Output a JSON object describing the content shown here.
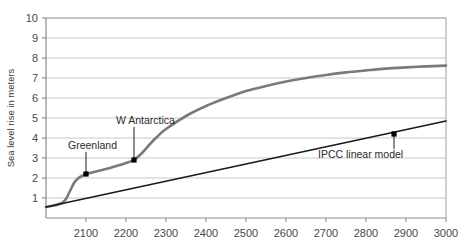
{
  "chart_data": {
    "type": "line",
    "title": "",
    "xlabel": "",
    "ylabel": "Sea level rise in meters",
    "xlim": [
      2000,
      3000
    ],
    "ylim": [
      0,
      10
    ],
    "grid": true,
    "legend": "none",
    "xticks": [
      2100,
      2200,
      2300,
      2400,
      2500,
      2600,
      2700,
      2800,
      2900,
      3000
    ],
    "xtick_labels": [
      "2100",
      "2200",
      "2300",
      "2400",
      "2500",
      "2600",
      "2700",
      "2800",
      "2900",
      "3000"
    ],
    "yticks": [
      1,
      2,
      3,
      4,
      5,
      6,
      7,
      8,
      9,
      10
    ],
    "ytick_labels": [
      "1",
      "2",
      "3",
      "4",
      "5",
      "6",
      "7",
      "8",
      "9",
      "10"
    ],
    "series": [
      {
        "name": "ice-sheet collapse curve",
        "color": "#7a7a7a",
        "x": [
          2000,
          2020,
          2040,
          2050,
          2060,
          2070,
          2080,
          2090,
          2100,
          2120,
          2140,
          2160,
          2180,
          2200,
          2220,
          2240,
          2260,
          2280,
          2300,
          2350,
          2400,
          2450,
          2500,
          2550,
          2600,
          2650,
          2700,
          2750,
          2800,
          2850,
          2900,
          2950,
          3000
        ],
        "values": [
          0.55,
          0.62,
          0.75,
          0.95,
          1.35,
          1.75,
          1.98,
          2.1,
          2.2,
          2.3,
          2.4,
          2.5,
          2.62,
          2.75,
          2.9,
          3.25,
          3.7,
          4.1,
          4.45,
          5.1,
          5.6,
          6.0,
          6.35,
          6.6,
          6.82,
          7.0,
          7.15,
          7.28,
          7.38,
          7.47,
          7.53,
          7.58,
          7.62
        ]
      },
      {
        "name": "IPCC linear model",
        "color": "#1a1a1a",
        "x": [
          2000,
          3000
        ],
        "values": [
          0.55,
          4.85
        ]
      }
    ],
    "annotations": [
      {
        "label": "Greenland",
        "x": 2100,
        "y": 2.2,
        "text_x": 2055,
        "text_y": 3.45
      },
      {
        "label": "W Antarctica",
        "x": 2220,
        "y": 2.9,
        "text_x": 2175,
        "text_y": 4.7
      },
      {
        "label": "IPCC linear model",
        "x": 2870,
        "y": 4.2,
        "text_x": 2680,
        "text_y": 3.0
      }
    ]
  },
  "colors": {
    "grid": "#c9c9c9",
    "axis": "#8c8c8c",
    "curve": "#7a7a7a",
    "linear": "#1a1a1a",
    "marker": "#000000",
    "tick_text": "#4a4a4a",
    "axis_label": "#3b3b3b",
    "background": "#ffffff"
  }
}
